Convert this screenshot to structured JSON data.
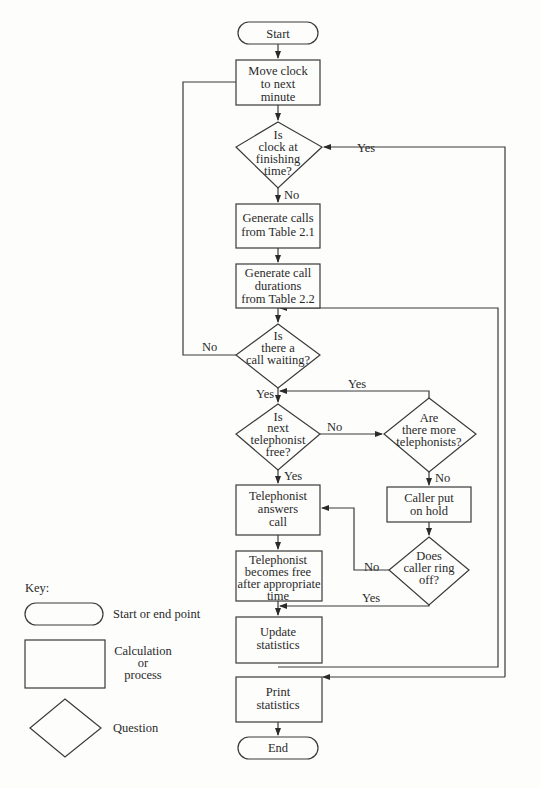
{
  "flowchart": {
    "start": "Start",
    "end": "End",
    "move_clock": [
      "Move clock",
      "to next",
      "minute"
    ],
    "finish_q": [
      "Is",
      "clock at",
      "finishing",
      "time?"
    ],
    "gen_calls": [
      "Generate calls",
      "from Table 2.1"
    ],
    "gen_durations": [
      "Generate call",
      "durations",
      "from Table 2.2"
    ],
    "waiting_q": [
      "Is",
      "there a",
      "call waiting?"
    ],
    "free_q": [
      "Is",
      "next",
      "telephonist",
      "free?"
    ],
    "more_q": [
      "Are",
      "there more",
      "telephonists?"
    ],
    "answers": [
      "Telephonist",
      "answers",
      "call"
    ],
    "hold": [
      "Caller put",
      "on hold"
    ],
    "ringoff_q": [
      "Does",
      "caller ring",
      "off?"
    ],
    "becomes_free": [
      "Telephonist",
      "becomes free",
      "after appropriate",
      "time"
    ],
    "update": [
      "Update",
      "statistics"
    ],
    "print": [
      "Print",
      "statistics"
    ],
    "labels": {
      "yes": "Yes",
      "no": "No"
    }
  },
  "key": {
    "title": "Key:",
    "items": [
      {
        "shape": "terminator",
        "label": [
          "Start or end point"
        ]
      },
      {
        "shape": "process",
        "label": [
          "Calculation",
          "or",
          "process"
        ]
      },
      {
        "shape": "decision",
        "label": [
          "Question"
        ]
      }
    ]
  }
}
